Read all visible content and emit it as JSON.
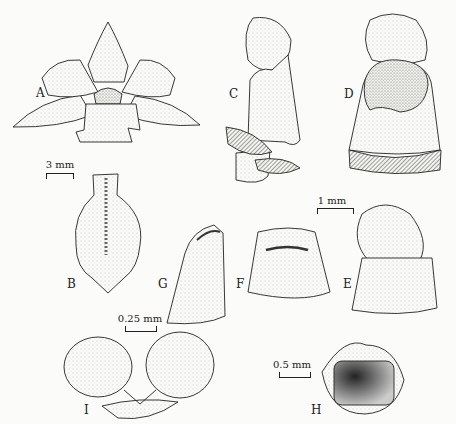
{
  "figure": {
    "panels": [
      {
        "id": "A",
        "label": "A",
        "desc": "whole flower, front view"
      },
      {
        "id": "B",
        "label": "B",
        "desc": "lip, flattened"
      },
      {
        "id": "C",
        "label": "C",
        "desc": "column, side view"
      },
      {
        "id": "D",
        "label": "D",
        "desc": "column, front view"
      },
      {
        "id": "E",
        "label": "E",
        "desc": "column apex with anther cap"
      },
      {
        "id": "F",
        "label": "F",
        "desc": "column apex, anther removed"
      },
      {
        "id": "G",
        "label": "G",
        "desc": "column apex, side view"
      },
      {
        "id": "H",
        "label": "H",
        "desc": "anther cap, inner view"
      },
      {
        "id": "I",
        "label": "I",
        "desc": "pollinarium"
      }
    ],
    "scale_bars": {
      "ab": "3 mm",
      "cdefg": "1 mm",
      "i": "0.25 mm",
      "h": "0.5 mm"
    },
    "colors": {
      "ink": "#222222",
      "paper": "#fbfbf9",
      "stipple": "#9a9a96",
      "hatch": "#555555"
    }
  }
}
